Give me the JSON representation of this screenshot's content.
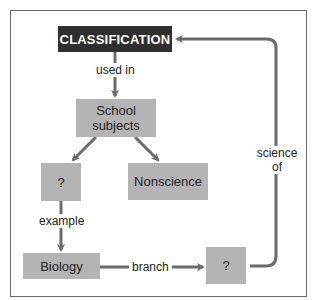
{
  "diagram": {
    "type": "concept-map",
    "colors": {
      "root_fill": "#2f2f2f",
      "root_text": "#ffffff",
      "node_fill": "#b4b4b4",
      "node_text": "#222222",
      "link": "#6b6b6b",
      "frame": "#6a6a6a"
    },
    "nodes": {
      "classification": "CLASSIFICATION",
      "school_subjects": "School\nsubjects",
      "school_subjects_line1": "School",
      "school_subjects_line2": "subjects",
      "unknown_left": "?",
      "nonscience": "Nonscience",
      "biology": "Biology",
      "unknown_right": "?"
    },
    "links": {
      "used_in": "used in",
      "example": "example",
      "branch": "branch",
      "science_of_line1": "science",
      "science_of_line2": "of"
    },
    "edges": [
      {
        "from": "CLASSIFICATION",
        "to": "School subjects",
        "label": "used in"
      },
      {
        "from": "School subjects",
        "to": "?",
        "label": ""
      },
      {
        "from": "School subjects",
        "to": "Nonscience",
        "label": ""
      },
      {
        "from": "?",
        "to": "Biology",
        "label": "example"
      },
      {
        "from": "Biology",
        "to": "?",
        "label": "branch"
      },
      {
        "from": "?",
        "to": "CLASSIFICATION",
        "label": "science of"
      }
    ]
  }
}
